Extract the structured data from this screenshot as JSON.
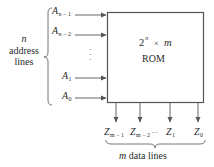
{
  "diagram": {
    "type": "ROM block diagram",
    "rom_box": {
      "size_base": "2",
      "size_exp": "n",
      "size_times": "×",
      "size_m": "m",
      "name": "ROM"
    },
    "address_group": {
      "line1": "n",
      "line2": "address",
      "line3": "lines"
    },
    "inputs": [
      {
        "name": "A",
        "sub": "n − 1"
      },
      {
        "name": "A",
        "sub": "n − 2"
      },
      {
        "name": "A",
        "sub": "1"
      },
      {
        "name": "A",
        "sub": "0"
      }
    ],
    "input_ellipsis": "⋮",
    "outputs": [
      {
        "name": "Z",
        "sub": "m − 1"
      },
      {
        "name": "Z",
        "sub": "m − 2"
      },
      {
        "name": "Z",
        "sub": "1"
      },
      {
        "name": "Z",
        "sub": "0"
      }
    ],
    "output_ellipsis": "···",
    "data_group": {
      "var": "m",
      "text": " data lines"
    },
    "colors": {
      "stroke": "#555555",
      "text": "#2a2a2a",
      "background": "#ffffff"
    }
  }
}
